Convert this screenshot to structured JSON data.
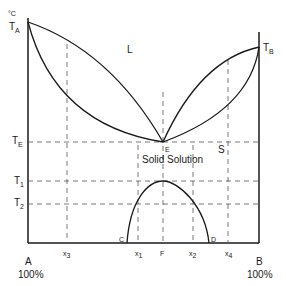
{
  "diagram": {
    "axis_unit": "°C",
    "temperatures": {
      "TA": {
        "main": "T",
        "sub": "A"
      },
      "TB": {
        "main": "T",
        "sub": "B"
      },
      "TE": {
        "main": "T",
        "sub": "E"
      },
      "T1": {
        "main": "T",
        "sub": "1"
      },
      "T2": {
        "main": "T",
        "sub": "2"
      }
    },
    "regions": {
      "liquid": "L",
      "solid": "S",
      "solid_solution": "Solid Solution"
    },
    "points": {
      "E": "E",
      "C": "C",
      "D": "D"
    },
    "compositions": {
      "x3": {
        "main": "x",
        "sub": "3"
      },
      "x1": {
        "main": "x",
        "sub": "1"
      },
      "F": "F",
      "x2": {
        "main": "x",
        "sub": "2"
      },
      "x4": {
        "main": "x",
        "sub": "4"
      }
    },
    "ends": {
      "A_label": "A",
      "A_pct": "100%",
      "B_label": "B",
      "B_pct": "100%"
    }
  }
}
